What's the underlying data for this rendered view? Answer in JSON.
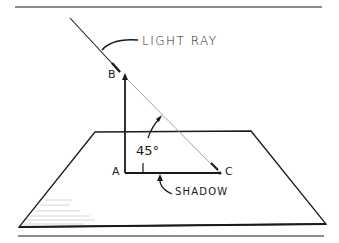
{
  "diagram": {
    "labels": {
      "light_ray": "LIGHT RAY",
      "point_b": "B",
      "point_a": "A",
      "point_c": "C",
      "angle": "45°",
      "shadow": "SHADOW"
    },
    "colors": {
      "ink": "#1a1a1a",
      "ray_faint": "#9a9a9a",
      "background": "#ffffff"
    }
  }
}
